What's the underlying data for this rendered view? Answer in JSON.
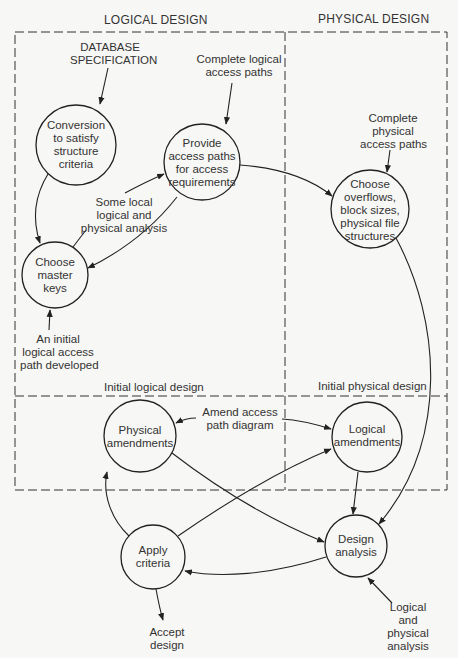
{
  "colors": {
    "background": "#f7f7f5",
    "ink": "#222222"
  },
  "regions": {
    "logical_design": "LOGICAL DESIGN",
    "physical_design": "PHYSICAL DESIGN",
    "initial_logical_design": "Initial logical design",
    "initial_physical_design": "Initial physical design"
  },
  "nodes": {
    "conversion": "Conversion\nto satisfy\nstructure\ncriteria",
    "provide_access_paths": "Provide\naccess paths\nfor access\nrequirements",
    "choose_master_keys": "Choose\nmaster\nkeys",
    "choose_overflows": "Choose\noverflows,\nblock sizes,\nphysical file\nstructures",
    "physical_amendments": "Physical\namendments",
    "logical_amendments": "Logical\namendments",
    "apply_criteria": "Apply\ncriteria",
    "design_analysis": "Design\nanalysis"
  },
  "annotations": {
    "database_specification": "DATABASE\nSPECIFICATION",
    "complete_logical_access_paths": "Complete logical\naccess paths",
    "complete_physical_access_paths": "Complete\nphysical\naccess paths",
    "some_local_analysis": "Some local\nlogical and\nphysical analysis",
    "initial_logical_access_path": "An initial\nlogical access\npath developed",
    "amend_access_path_diagram": "Amend access\npath diagram",
    "accept_design": "Accept\ndesign",
    "logical_and_physical_analysis": "Logical\nand\nphysical\nanalysis"
  }
}
